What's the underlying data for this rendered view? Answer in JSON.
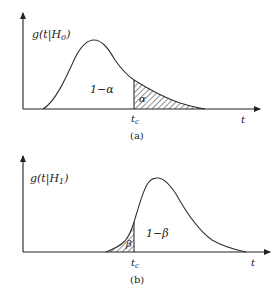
{
  "figure": {
    "panels": [
      {
        "id": "a",
        "caption": "(a)",
        "ylabel": "g(t|H",
        "ylabel_sub": "0",
        "ylabel_close": ")",
        "xlabel": "t",
        "threshold_label": "t",
        "threshold_sub": "c",
        "region_unshaded": "1−α",
        "region_shaded": "α"
      },
      {
        "id": "b",
        "caption": "(b)",
        "ylabel": "g(t|H",
        "ylabel_sub": "1",
        "ylabel_close": ")",
        "xlabel": "t",
        "threshold_label": "t",
        "threshold_sub": "c",
        "region_unshaded": "1−β",
        "region_shaded": "β"
      }
    ],
    "colors": {
      "line": "#333333",
      "hatch": "#333333",
      "text": "#222222"
    }
  }
}
